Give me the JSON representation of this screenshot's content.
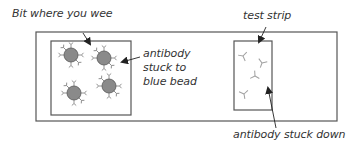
{
  "diagram": {
    "labels": {
      "wee_area": "Bit where you wee",
      "bead_antibody_line1": "antibody",
      "bead_antibody_line2": "stuck to",
      "bead_antibody_line3": "blue bead",
      "test_strip": "test strip",
      "antibody_stuck_down": "antibody stuck down"
    },
    "components": {
      "outer_stick": {
        "x": 36,
        "y": 32,
        "w": 301,
        "h": 89
      },
      "wee_box": {
        "x": 51,
        "y": 41,
        "w": 80,
        "h": 74
      },
      "test_strip": {
        "x": 234,
        "y": 41,
        "w": 38,
        "h": 69
      }
    },
    "beads": [
      {
        "cx": 71,
        "cy": 55
      },
      {
        "cx": 104,
        "cy": 58
      },
      {
        "cx": 74,
        "cy": 93
      },
      {
        "cx": 109,
        "cy": 86
      }
    ],
    "free_antibodies": [
      {
        "x": 243,
        "y": 56,
        "rot": 0
      },
      {
        "x": 262,
        "y": 63,
        "rot": 40
      },
      {
        "x": 255,
        "y": 76,
        "rot": -30
      },
      {
        "x": 243,
        "y": 94,
        "rot": 10
      }
    ],
    "colors": {
      "line": "#555555",
      "bead_fill": "#8a8a8a",
      "bead_stroke": "#555555",
      "antibody": "#999999",
      "text": "#333333"
    }
  }
}
